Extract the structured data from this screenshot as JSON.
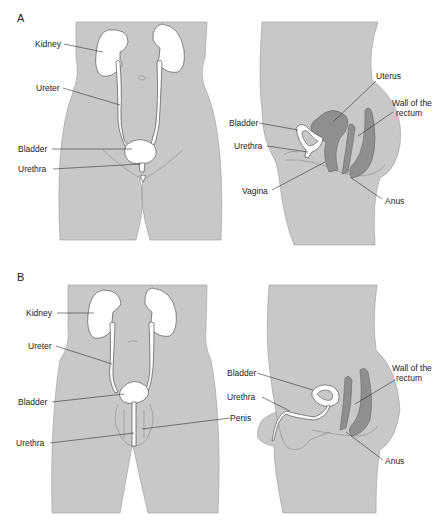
{
  "colors": {
    "body_fill": "#c8c8c8",
    "organ_fill": "#ffffff",
    "dark_organ_fill": "#8f8f8f",
    "label_text": "#222222"
  },
  "panels": [
    {
      "id": "A",
      "label": "A",
      "front_view": {
        "labels": [
          "Kidney",
          "Ureter",
          "Bladder",
          "Urethra"
        ]
      },
      "side_view": {
        "labels": [
          "Uterus",
          "Wall of the",
          "rectum",
          "Bladder",
          "Urethra",
          "Vagina",
          "Anus"
        ]
      }
    },
    {
      "id": "B",
      "label": "B",
      "front_view": {
        "labels": [
          "Kidney",
          "Ureter",
          "Bladder",
          "Urethra",
          "Penis"
        ]
      },
      "side_view": {
        "labels": [
          "Wall of the",
          "rectum",
          "Bladder",
          "Urethra",
          "Anus"
        ]
      }
    }
  ]
}
